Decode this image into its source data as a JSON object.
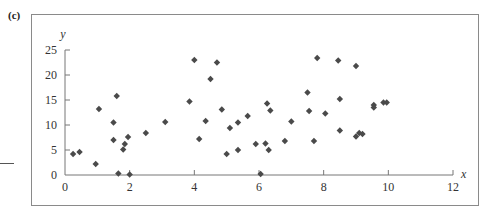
{
  "panel_label": "(c)",
  "chart_data": {
    "type": "scatter",
    "title": "",
    "xlabel": "x",
    "ylabel": "y",
    "xlim": [
      0,
      12
    ],
    "ylim": [
      0,
      25
    ],
    "xticks": [
      0,
      2,
      4,
      6,
      8,
      10,
      12
    ],
    "yticks": [
      0,
      5,
      10,
      15,
      20,
      25
    ],
    "grid": false,
    "legend": null,
    "marker": "diamond",
    "marker_color": "#4a4a4a",
    "points": [
      {
        "x": 0.25,
        "y": 4.2
      },
      {
        "x": 0.45,
        "y": 4.6
      },
      {
        "x": 0.95,
        "y": 2.2
      },
      {
        "x": 1.05,
        "y": 13.2
      },
      {
        "x": 1.5,
        "y": 10.5
      },
      {
        "x": 1.5,
        "y": 7.0
      },
      {
        "x": 1.6,
        "y": 15.8
      },
      {
        "x": 1.65,
        "y": 0.3
      },
      {
        "x": 1.8,
        "y": 5.1
      },
      {
        "x": 1.85,
        "y": 6.2
      },
      {
        "x": 1.95,
        "y": 7.6
      },
      {
        "x": 2.0,
        "y": 0.1
      },
      {
        "x": 2.5,
        "y": 8.4
      },
      {
        "x": 3.1,
        "y": 10.6
      },
      {
        "x": 3.85,
        "y": 14.7
      },
      {
        "x": 4.0,
        "y": 23.0
      },
      {
        "x": 4.15,
        "y": 7.2
      },
      {
        "x": 4.35,
        "y": 10.8
      },
      {
        "x": 4.5,
        "y": 19.2
      },
      {
        "x": 4.7,
        "y": 22.5
      },
      {
        "x": 4.85,
        "y": 13.1
      },
      {
        "x": 5.0,
        "y": 4.2
      },
      {
        "x": 5.1,
        "y": 9.4
      },
      {
        "x": 5.35,
        "y": 5.0
      },
      {
        "x": 5.35,
        "y": 10.5
      },
      {
        "x": 5.65,
        "y": 11.8
      },
      {
        "x": 5.9,
        "y": 6.2
      },
      {
        "x": 6.05,
        "y": 0.2
      },
      {
        "x": 6.2,
        "y": 6.3
      },
      {
        "x": 6.25,
        "y": 14.3
      },
      {
        "x": 6.3,
        "y": 5.0
      },
      {
        "x": 6.35,
        "y": 12.9
      },
      {
        "x": 6.8,
        "y": 6.8
      },
      {
        "x": 7.0,
        "y": 10.7
      },
      {
        "x": 7.5,
        "y": 16.5
      },
      {
        "x": 7.55,
        "y": 12.8
      },
      {
        "x": 7.7,
        "y": 6.8
      },
      {
        "x": 7.8,
        "y": 23.4
      },
      {
        "x": 8.05,
        "y": 12.3
      },
      {
        "x": 8.45,
        "y": 22.9
      },
      {
        "x": 8.5,
        "y": 15.2
      },
      {
        "x": 8.5,
        "y": 8.9
      },
      {
        "x": 9.0,
        "y": 21.8
      },
      {
        "x": 9.0,
        "y": 7.7
      },
      {
        "x": 9.1,
        "y": 8.4
      },
      {
        "x": 9.2,
        "y": 8.2
      },
      {
        "x": 9.55,
        "y": 14.0
      },
      {
        "x": 9.55,
        "y": 13.5
      },
      {
        "x": 9.85,
        "y": 14.5
      },
      {
        "x": 9.95,
        "y": 14.5
      }
    ]
  }
}
